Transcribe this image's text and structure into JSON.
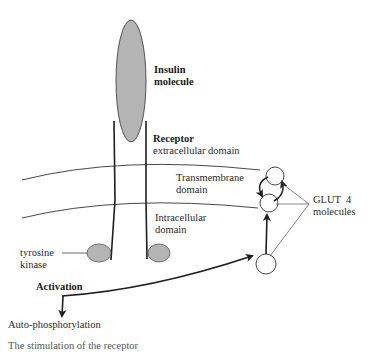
{
  "figure": {
    "top_cut_text": "…",
    "caption_cut": "The stimulation of the receptor"
  },
  "labels": {
    "insulin_line1": "Insulin",
    "insulin_line2": "molecule",
    "receptor_title": "Receptor",
    "receptor_extracellular": "extracellular domain",
    "transmembrane_line1": "Transmembrane",
    "transmembrane_line2": "domain",
    "intracellular_line1": "Intracellular",
    "intracellular_line2": "domain",
    "tyrosine_line1": "tyrosine",
    "tyrosine_line2": "kinase",
    "activation": "Activation",
    "auto_phosphorylation": "Auto-phosphorylation",
    "glut4_line1": "GLUT  4",
    "glut4_line2": "molecules"
  },
  "colors": {
    "shape_fill": "#b4b4b4",
    "line": "#1e1e1e",
    "thin_line": "#444444"
  },
  "shapes": {
    "insulin": {
      "cx": 131,
      "cy": 81,
      "rx": 15,
      "ry": 61
    },
    "kinase_left": {
      "cx": 99,
      "cy": 253,
      "rx": 12,
      "ry": 9
    },
    "kinase_right": {
      "cx": 159,
      "cy": 253,
      "rx": 11,
      "ry": 9
    },
    "glut4_top": {
      "cx": 275,
      "cy": 176,
      "r": 9
    },
    "glut4_mid": {
      "cx": 269,
      "cy": 203,
      "r": 9
    },
    "glut4_bottom": {
      "cx": 266,
      "cy": 264,
      "r": 10
    }
  }
}
